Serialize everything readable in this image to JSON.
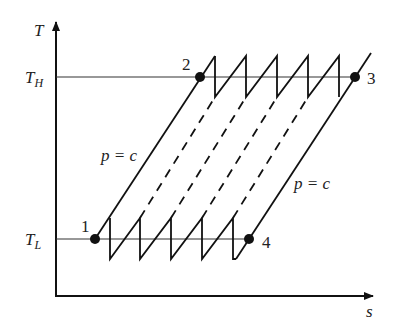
{
  "diagram": {
    "type": "T-s diagram (Ericsson cycle with regeneration)",
    "axes": {
      "y_label": "T",
      "x_label": "s",
      "th_label_main": "T",
      "th_label_sub": "H",
      "tl_label_main": "T",
      "tl_label_sub": "L"
    },
    "points": [
      {
        "id": "1",
        "label": "1"
      },
      {
        "id": "2",
        "label": "2"
      },
      {
        "id": "3",
        "label": "3"
      },
      {
        "id": "4",
        "label": "4"
      }
    ],
    "process_labels": {
      "left_isobar": "p = c",
      "right_isobar": "p = c"
    },
    "colors": {
      "line": "#111111",
      "text": "#222222",
      "background": "#ffffff"
    }
  }
}
